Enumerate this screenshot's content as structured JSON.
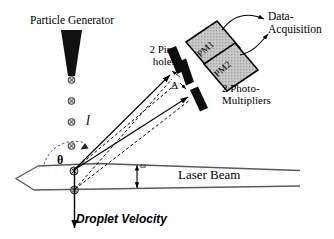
{
  "figure": {
    "background_color": "#ffffff",
    "ink_color": "#000000",
    "box_fill_color": "#c8c8c8"
  },
  "labels": {
    "particle_generator": "Particle Generator",
    "pinholes": "2 Pin-\nholes",
    "data_acquisition": "Data-\nAcquisition",
    "photomultipliers": "2 Photo-\nMultipliers",
    "laser_beam": "Laser Beam",
    "droplet_velocity": "Droplet Velocity",
    "distance_l": "l",
    "theta": "θ",
    "omega": "ω",
    "delta": "Δ",
    "pm1": "PM1",
    "pm2": "PM2"
  },
  "components": {
    "nozzle": "particle-generator-nozzle",
    "droplets_count": 6,
    "pinhole_plates_count": 3,
    "photomultiplier_boxes": [
      "PM1",
      "PM2"
    ],
    "laser_beam_arrow_direction": "left",
    "droplet_velocity_arrow_direction": "down"
  }
}
